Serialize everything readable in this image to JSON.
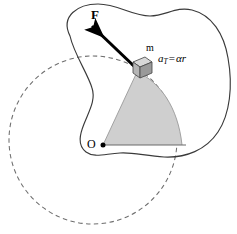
{
  "figure": {
    "type": "physics-diagram",
    "width": 237,
    "height": 234,
    "background_color": "#ffffff"
  },
  "labels": {
    "force": "F",
    "mass": "m",
    "origin": "O",
    "accel_symbol": "a",
    "accel_subscript": "T",
    "accel_equals": "=",
    "accel_expression": "αr"
  },
  "colors": {
    "outline": "#3a3a3a",
    "sector_fill": "#cfcfcf",
    "sector_stroke": "#8a8a8a",
    "dashed_circle": "#6e6e6e",
    "arrow": "#000000",
    "cube_face": "#b5b5b5",
    "cube_top": "#d8d8d8",
    "cube_side": "#9a9a9a",
    "pivot_dot": "#000000",
    "text": "#000000"
  },
  "geometry": {
    "pivot": {
      "x": 103,
      "y": 145
    },
    "mass_position": {
      "x": 139,
      "y": 70
    },
    "force_arrow": {
      "tail_x": 136,
      "tail_y": 68,
      "tip_x": 87,
      "tip_y": 21
    },
    "baseline": {
      "x1": 103,
      "y1": 145,
      "x2": 186,
      "y2": 145
    },
    "dashed_circle": {
      "cx": 93,
      "cy": 140,
      "r": 84
    },
    "sector_radius": 83
  },
  "label_positions": {
    "force": {
      "left": 91,
      "top": 8
    },
    "mass": {
      "left": 146,
      "top": 44
    },
    "origin": {
      "left": 88,
      "top": 138
    },
    "accel": {
      "left": 158,
      "top": 52
    }
  },
  "paths": {
    "body_outline": "M 70,36 C 60,16 78,4 98,4 C 118,4 132,16 150,16 C 166,16 176,6 192,10 C 212,15 224,34 228,58 C 233,86 230,114 218,132 C 206,150 186,158 164,157 C 146,156 132,152 120,153 C 104,154 94,158 86,152 C 77,145 80,134 84,124 C 89,111 96,100 92,88 C 88,74 74,54 70,36 Z",
    "sector": "M 103,145 L 137,72 C 160,82 178,107 182,145 Z",
    "sector_arc_edge": "M 137,72 C 160,82 178,107 182,145",
    "cube": {
      "top": "M 133,62 L 145,57 L 152,62 L 140,67 Z",
      "front": "M 133,62 L 140,67 L 140,78 L 133,73 Z",
      "side": "M 140,67 L 152,62 L 152,73 L 140,78 Z"
    }
  }
}
